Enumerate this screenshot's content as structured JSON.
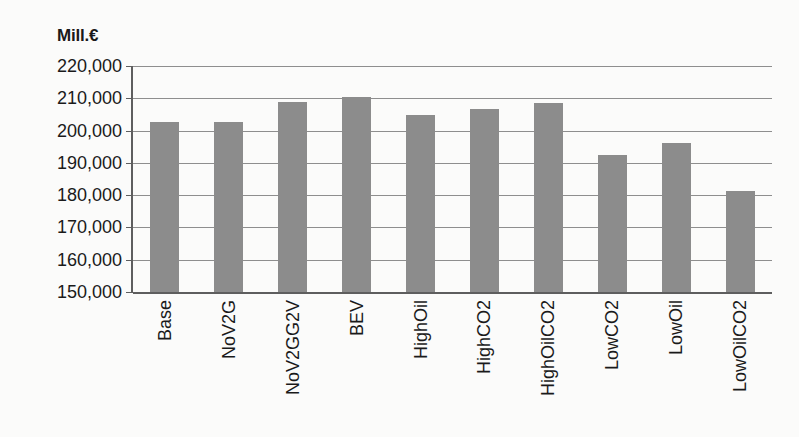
{
  "chart_data": {
    "type": "bar",
    "title": "",
    "subtitle": "",
    "xlabel": "",
    "ylabel": "Mill.€",
    "unit_caption": "Mill.€",
    "categories": [
      "Base",
      "NoV2G",
      "NoV2GG2V",
      "BEV",
      "HighOil",
      "HighCO2",
      "HighOilCO2",
      "LowCO2",
      "LowOil",
      "LowOilCO2"
    ],
    "values": [
      202700,
      202700,
      208800,
      210500,
      204800,
      206700,
      208500,
      192300,
      196100,
      181200
    ],
    "series": [
      {
        "name": "Total system cost",
        "values": [
          202700,
          202700,
          208800,
          210500,
          204800,
          206700,
          208500,
          192300,
          196100,
          181200
        ]
      }
    ],
    "ylim": [
      150000,
      220000
    ],
    "ytick_step": 10000,
    "ytick_labels": [
      "220,000",
      "210,000",
      "200,000",
      "190,000",
      "180,000",
      "170,000",
      "160,000",
      "150,000"
    ],
    "ytick_values": [
      220000,
      210000,
      200000,
      190000,
      180000,
      170000,
      160000,
      150000
    ],
    "grid": true,
    "grid_axis": "y",
    "legend": false,
    "legend_position": "none",
    "bar_color": "#8c8c8c",
    "axis_color": "#5e5e5e",
    "gridline_color": "#8e8e8e",
    "background_color": "#fbfbfa",
    "annotations": []
  }
}
